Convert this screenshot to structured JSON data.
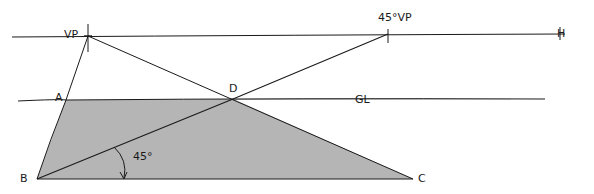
{
  "diagram": {
    "type": "perspective-construction",
    "labels": {
      "vp": "VP",
      "vp45": "45°VP",
      "horizon": "H",
      "ground_line": "GL",
      "a": "A",
      "b": "B",
      "c": "C",
      "d": "D",
      "angle": "45°"
    },
    "points": {
      "VP": [
        88,
        36
      ],
      "VP45": [
        388,
        34
      ],
      "A": [
        66,
        100
      ],
      "B": [
        37,
        179
      ],
      "C": [
        413,
        179
      ],
      "D": [
        233,
        99
      ]
    },
    "lines": {
      "horizon": [
        [
          12,
          37
        ],
        [
          565,
          34
        ]
      ],
      "ground_line": [
        [
          18,
          101
        ],
        [
          545,
          99
        ]
      ]
    },
    "colors": {
      "ink": "#1a1a1a",
      "fill": "#b4b4b4",
      "background": "#ffffff"
    }
  }
}
